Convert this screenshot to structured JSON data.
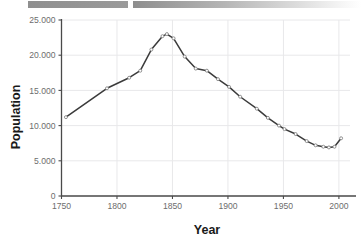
{
  "banner": {
    "segment_left_color": "#8f8f8f",
    "segment_right_color": "#b5b5b5"
  },
  "chart_data": {
    "type": "line",
    "title": "",
    "xlabel": "Year",
    "ylabel": "Population",
    "xlim": [
      1750,
      2010
    ],
    "ylim": [
      0,
      25000
    ],
    "grid": true,
    "legend": "none",
    "line_color": "#3b3b3b",
    "marker_color": "#ffffff",
    "marker_edge_color": "#7a7a7a",
    "xticks": [
      1750,
      1800,
      1850,
      1900,
      1950,
      2000
    ],
    "xticklabels": [
      "1750",
      "1800",
      "1850",
      "1900",
      "1950",
      "2000"
    ],
    "yticks": [
      0,
      5000,
      10000,
      15000,
      20000,
      25000
    ],
    "yticklabels": [
      "0",
      "5.000",
      "10.000",
      "15.000",
      "20.000",
      "25.000"
    ],
    "x": [
      1754,
      1791,
      1811,
      1821,
      1831,
      1841,
      1845,
      1851,
      1861,
      1871,
      1881,
      1891,
      1901,
      1911,
      1926,
      1936,
      1946,
      1951,
      1961,
      1971,
      1979,
      1986,
      1991,
      1996,
      2002
    ],
    "values": [
      11200,
      15300,
      16800,
      17800,
      20800,
      22700,
      23000,
      22400,
      19800,
      18100,
      17800,
      16600,
      15500,
      14100,
      12400,
      11100,
      10000,
      9500,
      8800,
      7800,
      7200,
      7000,
      6900,
      7000,
      8200
    ],
    "series": [
      {
        "name": "Population",
        "points": [
          {
            "year": 1754,
            "population": 11200
          },
          {
            "year": 1791,
            "population": 15300
          },
          {
            "year": 1811,
            "population": 16800
          },
          {
            "year": 1821,
            "population": 17800
          },
          {
            "year": 1831,
            "population": 20800
          },
          {
            "year": 1841,
            "population": 22700
          },
          {
            "year": 1845,
            "population": 23000
          },
          {
            "year": 1851,
            "population": 22400
          },
          {
            "year": 1861,
            "population": 19800
          },
          {
            "year": 1871,
            "population": 18100
          },
          {
            "year": 1881,
            "population": 17800
          },
          {
            "year": 1891,
            "population": 16600
          },
          {
            "year": 1901,
            "population": 15500
          },
          {
            "year": 1911,
            "population": 14100
          },
          {
            "year": 1926,
            "population": 12400
          },
          {
            "year": 1936,
            "population": 11100
          },
          {
            "year": 1946,
            "population": 10000
          },
          {
            "year": 1951,
            "population": 9500
          },
          {
            "year": 1961,
            "population": 8800
          },
          {
            "year": 1971,
            "population": 7800
          },
          {
            "year": 1979,
            "population": 7200
          },
          {
            "year": 1986,
            "population": 7000
          },
          {
            "year": 1991,
            "population": 6900
          },
          {
            "year": 1996,
            "population": 7000
          },
          {
            "year": 2002,
            "population": 8200
          }
        ]
      }
    ]
  }
}
